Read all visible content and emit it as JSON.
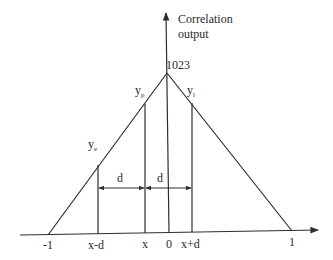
{
  "diagram": {
    "type": "triangular-correlation-peak",
    "y_axis_label_line1": "Correlation",
    "y_axis_label_line2": "output",
    "peak_value_label": "1023",
    "points": {
      "ye": {
        "main": "y",
        "sub": "e"
      },
      "yp": {
        "main": "y",
        "sub": "p"
      },
      "yl": {
        "main": "y",
        "sub": "l"
      }
    },
    "spacing_label_left": "d",
    "spacing_label_right": "d",
    "x_ticks": {
      "neg_one": "-1",
      "x_minus_d": "x-d",
      "x": "x",
      "zero": "0",
      "x_plus_d": "x+d",
      "one": "1"
    },
    "colors": {
      "stroke": "#2e2e2e",
      "background": "#ffffff"
    }
  }
}
